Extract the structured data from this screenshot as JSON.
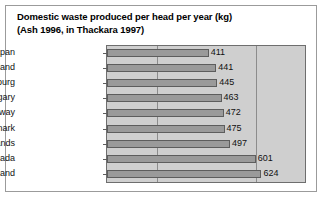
{
  "chart_data": {
    "type": "bar",
    "orientation": "horizontal",
    "title": "Domestic waste produced per head per year (kg)",
    "subtitle": "(Ash 1996, in Thackara 1997)",
    "title_lines": [
      "Domestic waste produced per head per year (kg)",
      "(Ash 1996, in Thackara 1997)"
    ],
    "xlabel": "",
    "ylabel": "",
    "categories": [
      "Japan",
      "Switzerland",
      "Luxembourg",
      "Hungary",
      "Norway",
      "Denmark",
      "The Netherlands",
      "Canada",
      "Finland"
    ],
    "values": [
      411,
      441,
      445,
      463,
      472,
      475,
      497,
      601,
      624
    ],
    "value_labels": [
      "411",
      "441",
      "445",
      "463",
      "472",
      "475",
      "497",
      "601",
      "624"
    ],
    "units": "kg",
    "xlim": [
      0,
      800
    ],
    "gridlines": [
      200,
      600
    ],
    "grid": true,
    "legend": "none",
    "colors": {
      "bar_fill": "#9a9a9a",
      "bar_border": "#5d5d5d",
      "plot_background": "#cfcfcf",
      "gridline": "#8c8c8c",
      "frame": "#9b9b9b",
      "text": "#111111"
    }
  }
}
